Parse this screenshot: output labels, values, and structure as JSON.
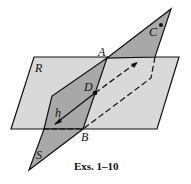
{
  "figure": {
    "caption": "Exs. 1–10",
    "planes": [
      {
        "name": "R",
        "fill": "#d9d9d9"
      },
      {
        "name": "S",
        "fill": "#a8a8a8"
      }
    ],
    "points": [
      {
        "name": "A"
      },
      {
        "name": "B"
      },
      {
        "name": "C"
      },
      {
        "name": "D"
      }
    ],
    "line": {
      "name": "h"
    }
  }
}
